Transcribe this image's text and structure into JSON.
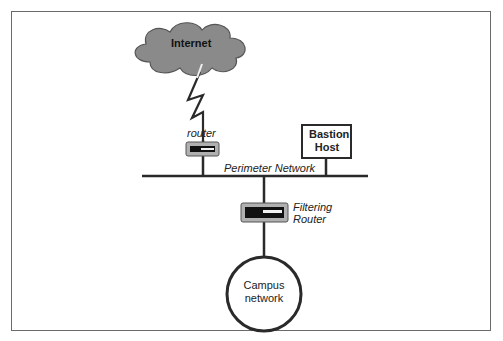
{
  "diagram": {
    "nodes": {
      "internet": {
        "label": "Internet",
        "shape": "cloud",
        "fill": "#8a8a8a"
      },
      "exterior_router": {
        "label": "router",
        "shape": "router"
      },
      "perimeter_network": {
        "label": "Perimeter Network",
        "shape": "bus-line"
      },
      "bastion_host": {
        "label_line1": "Bastion",
        "label_line2": "Host",
        "shape": "box"
      },
      "filtering_router": {
        "label_line1": "Filtering",
        "label_line2": "Router",
        "shape": "router"
      },
      "campus_network": {
        "label_line1": "Campus",
        "label_line2": "network",
        "shape": "circle"
      }
    },
    "edges": [
      {
        "from": "internet",
        "to": "exterior_router",
        "style": "lightning"
      },
      {
        "from": "exterior_router",
        "to": "perimeter_network",
        "style": "line"
      },
      {
        "from": "bastion_host",
        "to": "perimeter_network",
        "style": "line"
      },
      {
        "from": "perimeter_network",
        "to": "filtering_router",
        "style": "line"
      },
      {
        "from": "filtering_router",
        "to": "campus_network",
        "style": "line"
      }
    ],
    "colors": {
      "line": "#2a2a2a",
      "cloud": "#8a8a8a",
      "router_body": "#b0b0b0",
      "frame": "#6a6a6a"
    }
  }
}
